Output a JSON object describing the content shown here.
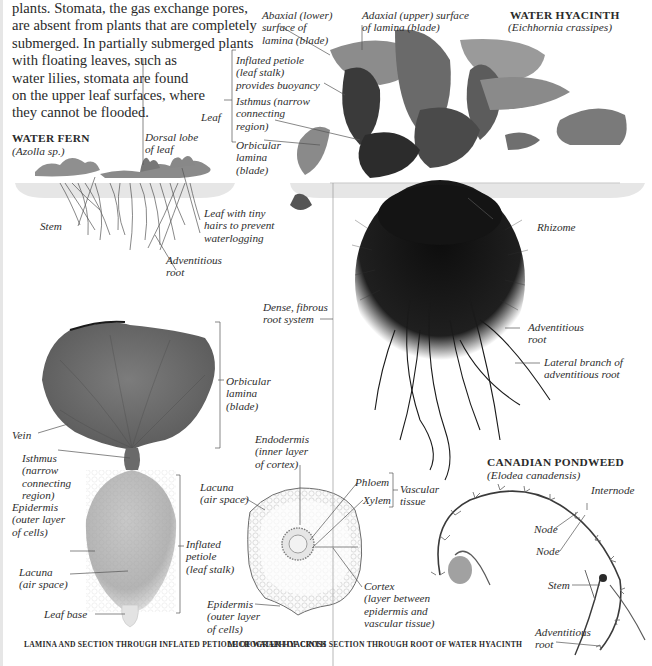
{
  "intro_text": {
    "lines": [
      "plants. Stomata, the gas exchange pores,",
      "are absent from plants that are completely",
      "submerged. In partially submerged plants",
      "with floating leaves, such as",
      "water lilies, stomata are found",
      "on the upper leaf surfaces, where",
      "they cannot be flooded."
    ]
  },
  "water_fern": {
    "title": "WATER FERN",
    "scientific_name": "(Azolla sp.)",
    "labels": {
      "dorsal_lobe": "Dorsal lobe\nof leaf",
      "stem": "Stem",
      "leaf_hairs": "Leaf with tiny\nhairs to prevent\nwaterlogging",
      "adventitious_root": "Adventitious\nroot"
    }
  },
  "water_hyacinth": {
    "title": "WATER HYACINTH",
    "scientific_name": "(Eichhornia crassipes)",
    "labels": {
      "abaxial": "Abaxial (lower)\nsurface of\nlamina (blade)",
      "adaxial": "Adaxial (upper) surface\nof lamina (blade)",
      "inflated_petiole": "Inflated petiole\n(leaf stalk)\nprovides buoyancy",
      "isthmus": "Isthmus (narrow\nconnecting\nregion)",
      "orbicular_lamina": "Orbicular\nlamina\n(blade)",
      "leaf_group": "Leaf",
      "rhizome": "Rhizome",
      "fibrous_root": "Dense, fibrous\nroot system",
      "adventitious_root": "Adventitious\nroot",
      "lateral_branch": "Lateral branch of\nadventitious root"
    }
  },
  "lamina_section": {
    "labels": {
      "vein": "Vein",
      "orbicular_lamina": "Orbicular\nlamina\n(blade)",
      "isthmus": "Isthmus\n(narrow\nconnecting\nregion)",
      "epidermis": "Epidermis\n(outer layer\nof cells)",
      "lacuna": "Lacuna\n(air space)",
      "inflated_petiole": "Inflated\npetiole\n(leaf stalk)",
      "leaf_base": "Leaf base"
    },
    "caption": "LAMINA AND SECTION THROUGH INFLATED\nPETIOLE OF WATER HYACINTH"
  },
  "root_micrograph": {
    "labels": {
      "endodermis": "Endodermis\n(inner layer\nof cortex)",
      "lacuna": "Lacuna\n(air space)",
      "phloem": "Phloem",
      "xylem": "Xylem",
      "vascular_tissue": "Vascular\ntissue",
      "cortex": "Cortex\n(layer between\nepidermis and\nvascular tissue)",
      "epidermis": "Epidermis\n(outer layer\nof cells)"
    },
    "caption": "MICROGRAPH OF CROSS SECTION\nTHROUGH ROOT OF WATER HYACINTH"
  },
  "canadian_pondweed": {
    "title": "CANADIAN PONDWEED",
    "scientific_name": "(Elodea canadensis)",
    "labels": {
      "internode": "Internode",
      "node_1": "Node",
      "node_2": "Node",
      "stem": "Stem",
      "adventitious_root": "Adventitious\nroot"
    }
  },
  "colors": {
    "text": "#2a2a2a",
    "leader_line": "#555555",
    "water_band": "#e8e8e8",
    "plant_dark": "#1a1a1a",
    "leaf_gray": "#7a7a7a"
  }
}
